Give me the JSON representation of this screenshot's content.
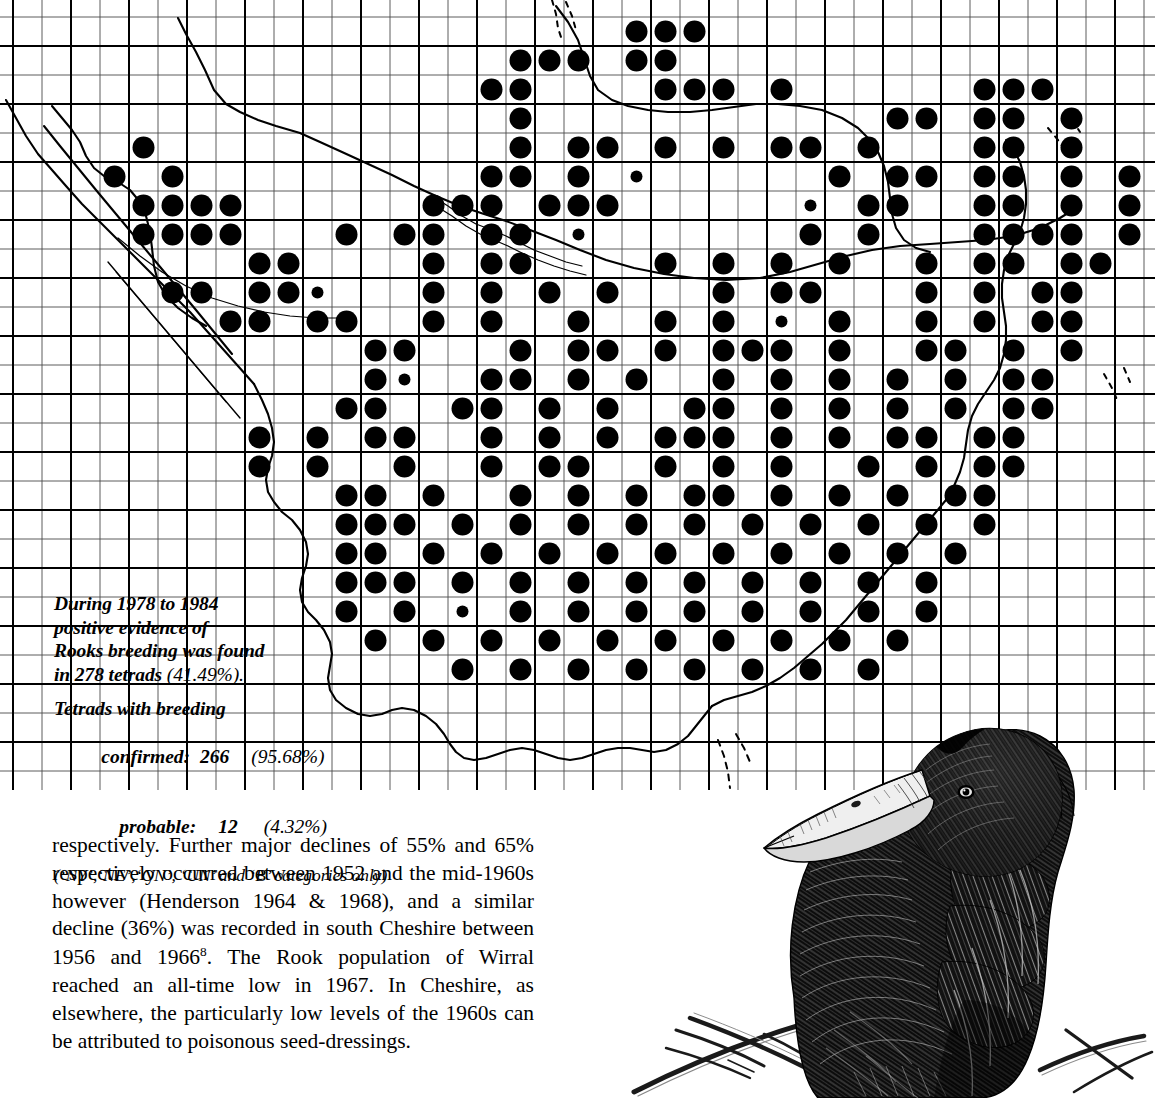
{
  "page": {
    "species": "Rook",
    "background_color": "#ffffff",
    "ink_color": "#000000"
  },
  "map": {
    "name": "rook-breeding-distribution-map",
    "region": "Cheshire",
    "grid": {
      "tetrad_cell_px": 29,
      "heavy_line_every": 2,
      "origin_x": 13,
      "origin_y": 104,
      "light_line_color": "#4a4a4a",
      "heavy_line_color": "#000000"
    },
    "symbols": {
      "confirmed": {
        "label": "breeding confirmed",
        "shape": "large-filled-circle",
        "radius_px": 11
      },
      "probable": {
        "label": "breeding probable",
        "shape": "small-filled-circle",
        "radius_px": 6
      }
    }
  },
  "caption": {
    "line1": "During 1978 to 1984",
    "line2": "positive evidence of",
    "line3": "Rooks breeding was found",
    "line4_prefix": "in 278 tetrads ",
    "line4_pct": "(41.49%).",
    "heading2": "Tetrads with breeding",
    "stats": [
      {
        "label": "confirmed:",
        "count": "266",
        "percent": "(95.68%)"
      },
      {
        "label": "probable:",
        "count": "12",
        "percent": "(4.32%)"
      }
    ],
    "categories_note": "(‘NY’,‘NE’,‘ON’, ‘UN’ and ‘B’ categories only)"
  },
  "body": {
    "paragraph_part1": "respectively. Further major declines of 55% and 65% respectively occurred between 1952 and the mid-1960s however (Henderson 1964 & 1968), and a similar decline (36%) was recorded in south Cheshire between 1956 and 1966",
    "footnote_marker": "8",
    "paragraph_part2": ". The Rook population of Wirral reached an all-time low in 1967. In Cheshire, as elsewhere, the particularly low levels of the 1960s can be attributed to poisonous seed-dressings."
  },
  "illustration": {
    "name": "rook-perched-on-branches",
    "subject": "Rook",
    "medium": "pen-and-ink drawing",
    "description": "Rook perched, viewed from behind with head turned left, showing pale bare-skinned dagger-shaped bill, on crossed bare twigs"
  },
  "chart_data": {
    "type": "map",
    "total_tetrads_occupied": 278,
    "total_tetrads_percent": 41.49,
    "breakdown": [
      {
        "category": "confirmed",
        "count": 266,
        "percent": 95.68,
        "symbol": "large-dot"
      },
      {
        "category": "probable",
        "count": 12,
        "percent": 4.32,
        "symbol": "small-dot"
      }
    ],
    "legend_position": "none",
    "grid": true
  }
}
